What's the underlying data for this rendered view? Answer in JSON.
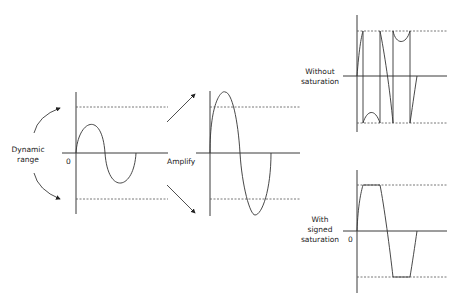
{
  "labels": {
    "dynamic_range_line1": "Dynamic",
    "dynamic_range_line2": "range",
    "zero_left": "0",
    "amplify": "Amplify",
    "without_line1": "Without",
    "without_line2": "saturation",
    "with_line1": "With",
    "with_line2": "signed",
    "with_line3": "saturation",
    "zero_bottom_right": "0"
  },
  "panels": [
    {
      "name": "original-signal",
      "description": "sine wave within dynamic range"
    },
    {
      "name": "amplified-signal",
      "description": "amplified sine exceeding dynamic range"
    },
    {
      "name": "without-saturation",
      "description": "wrapped-around overflow signal"
    },
    {
      "name": "with-signed-saturation",
      "description": "clipped signal at range limits"
    }
  ]
}
